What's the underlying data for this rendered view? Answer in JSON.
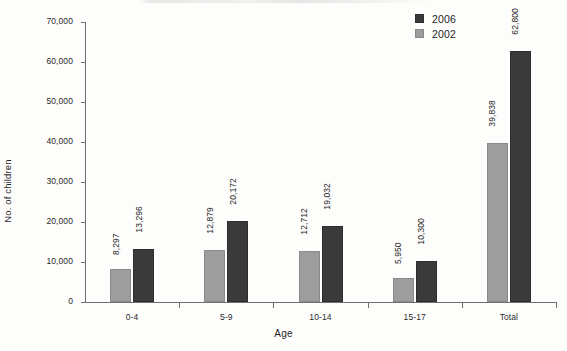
{
  "chart_data": {
    "type": "bar",
    "title": "",
    "xlabel": "Age",
    "ylabel": "No. of children",
    "categories": [
      "0-4",
      "5-9",
      "10-14",
      "15-17",
      "Total"
    ],
    "series": [
      {
        "name": "2002",
        "color": "#9d9d9d",
        "values": [
          8297,
          12879,
          12712,
          5950,
          39838
        ],
        "labels": [
          "8,297",
          "12,879",
          "12,712",
          "5,950",
          "39,838"
        ]
      },
      {
        "name": "2006",
        "color": "#3a3a3a",
        "values": [
          13296,
          20172,
          19032,
          10300,
          62800
        ],
        "labels": [
          "13,296",
          "20,172",
          "19,032",
          "10,300",
          "62,800"
        ]
      }
    ],
    "ylim": [
      0,
      70000
    ],
    "yticks": [
      0,
      10000,
      20000,
      30000,
      40000,
      50000,
      60000,
      70000
    ],
    "ytick_labels": [
      "0",
      "10,000",
      "20,000",
      "30,000",
      "40,000",
      "50,000",
      "60,000",
      "70,000"
    ],
    "grid": false,
    "legend_position": "top-right",
    "legend_order": [
      "2006",
      "2002"
    ]
  },
  "legend": {
    "entries": [
      {
        "label": "2006",
        "swatch": "s2006"
      },
      {
        "label": "2002",
        "swatch": "s2002"
      }
    ]
  }
}
